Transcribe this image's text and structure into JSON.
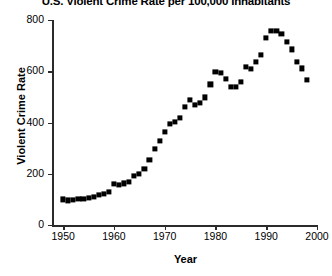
{
  "chart_data": {
    "type": "scatter",
    "title": "U.S. Violent Crime Rate per 100,000 Inhabitants",
    "xlabel": "Year",
    "ylabel": "Violent Crime Rate",
    "xlim": [
      1948,
      2000
    ],
    "ylim": [
      0,
      800
    ],
    "xticks": [
      1950,
      1960,
      1970,
      1980,
      1990,
      2000
    ],
    "xticklabels": [
      "1950",
      "1960",
      "1970",
      "1980",
      "1990",
      "2000"
    ],
    "yticks": [
      0,
      200,
      400,
      600,
      800
    ],
    "yticklabels": [
      "0",
      "200",
      "400",
      "600",
      "800"
    ],
    "grid": false,
    "legend": null,
    "marker": "filled-square",
    "series_color": "#000000",
    "x": [
      1950,
      1951,
      1952,
      1953,
      1954,
      1955,
      1956,
      1957,
      1958,
      1959,
      1960,
      1961,
      1962,
      1963,
      1964,
      1965,
      1966,
      1967,
      1968,
      1969,
      1970,
      1971,
      1972,
      1973,
      1974,
      1975,
      1976,
      1977,
      1978,
      1979,
      1980,
      1981,
      1982,
      1983,
      1984,
      1985,
      1986,
      1987,
      1988,
      1989,
      1990,
      1991,
      1992,
      1993,
      1994,
      1995,
      1996,
      1997,
      1998
    ],
    "values": [
      100,
      96,
      97,
      102,
      102,
      106,
      110,
      118,
      120,
      129,
      161,
      158,
      162,
      168,
      191,
      200,
      220,
      254,
      298,
      329,
      364,
      396,
      401,
      417,
      461,
      488,
      468,
      476,
      498,
      549,
      597,
      594,
      571,
      538,
      539,
      557,
      618,
      610,
      637,
      663,
      730,
      758,
      758,
      747,
      714,
      685,
      637,
      611,
      567
    ]
  }
}
